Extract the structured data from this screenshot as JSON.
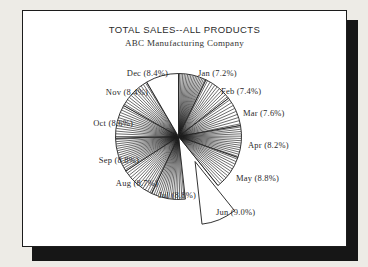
{
  "page": {
    "background_color": "#edebe6",
    "paper_color": "#ffffff",
    "ink_color": "#1c1c1c",
    "shadow_color": "#161616"
  },
  "chart_data": {
    "type": "pie",
    "title": "TOTAL SALES--ALL PRODUCTS",
    "subtitle": "ABC Manufacturing Company",
    "start_angle": "12 o'clock",
    "direction": "clockwise",
    "fill_style": "monochrome radial hatch",
    "legend_position": "none",
    "slices": [
      {
        "label": "Jan",
        "value": 7.2,
        "display": "Jan (7.2%)",
        "filled": true,
        "exploded": false
      },
      {
        "label": "Feb",
        "value": 7.4,
        "display": "Feb (7.4%)",
        "filled": true,
        "exploded": false
      },
      {
        "label": "Mar",
        "value": 7.6,
        "display": "Mar (7.6%)",
        "filled": true,
        "exploded": false
      },
      {
        "label": "Apr",
        "value": 8.2,
        "display": "Apr (8.2%)",
        "filled": true,
        "exploded": false
      },
      {
        "label": "May",
        "value": 8.8,
        "display": "May (8.8%)",
        "filled": true,
        "exploded": false
      },
      {
        "label": "Jun",
        "value": 9.0,
        "display": "Jun (9.0%)",
        "filled": false,
        "exploded": true
      },
      {
        "label": "Jul",
        "value": 8.8,
        "display": "Jul (8.8%)",
        "filled": true,
        "exploded": false
      },
      {
        "label": "Aug",
        "value": 8.7,
        "display": "Aug (8.7%)",
        "filled": true,
        "exploded": false
      },
      {
        "label": "Sep",
        "value": 8.8,
        "display": "Sep (8.8%)",
        "filled": true,
        "exploded": false
      },
      {
        "label": "Oct",
        "value": 8.6,
        "display": "Oct (8.6%)",
        "filled": true,
        "exploded": false
      },
      {
        "label": "Nov",
        "value": 8.4,
        "display": "Nov (8.4%)",
        "filled": true,
        "exploded": false
      },
      {
        "label": "Dec",
        "value": 8.4,
        "display": "Dec (8.4%)",
        "filled": false,
        "exploded": false
      }
    ]
  }
}
